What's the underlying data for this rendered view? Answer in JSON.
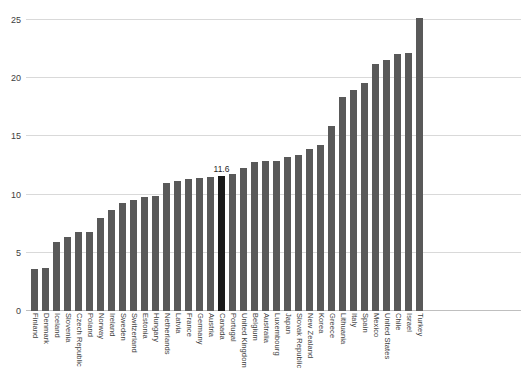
{
  "chart_data": {
    "type": "bar",
    "title": "",
    "subtitle": "",
    "xlabel": "",
    "ylabel": "",
    "ylim": [
      0,
      25
    ],
    "yticks": [
      0,
      5,
      10,
      15,
      20,
      25
    ],
    "ytick_labels": [
      "0",
      "5",
      "10",
      "15",
      "20",
      "25"
    ],
    "grid": true,
    "legend": null,
    "highlight_category": "Canada",
    "highlight_value_label": "11.6",
    "bar_color": "#595959",
    "highlight_color": "#1a1a1a",
    "gridline_color": "#d9d9d9",
    "categories": [
      "Finland",
      "Denmark",
      "Iceland",
      "Slovenia",
      "Czech Republic",
      "Poland",
      "Norway",
      "Ireland",
      "Sweden",
      "Switzerland",
      "Estonia",
      "Hungary",
      "Netherlands",
      "Latvia",
      "France",
      "Germany",
      "Austria",
      "Canada",
      "Portugal",
      "United Kingdom",
      "Belgium",
      "Australia",
      "Luxembourg",
      "Japan",
      "Slovak Republic",
      "New Zealand",
      "Korea",
      "Greece",
      "Lithuania",
      "Italy",
      "Spain",
      "Mexico",
      "United States",
      "Chile",
      "Israel",
      "Turkey"
    ],
    "values": [
      3.6,
      3.7,
      5.9,
      6.4,
      6.8,
      6.8,
      8.0,
      8.7,
      9.3,
      9.5,
      9.8,
      9.9,
      11.0,
      11.2,
      11.3,
      11.4,
      11.5,
      11.6,
      11.8,
      12.3,
      12.8,
      12.9,
      12.9,
      13.2,
      13.4,
      13.9,
      14.3,
      15.9,
      18.4,
      19.0,
      19.6,
      21.2,
      21.6,
      22.1,
      22.2,
      25.2
    ],
    "value_labels": [
      "",
      "",
      "",
      "",
      "",
      "",
      "",
      "",
      "",
      "",
      "",
      "",
      "",
      "",
      "",
      "",
      "",
      "11.6",
      "",
      "",
      "",
      "",
      "",
      "",
      "",
      "",
      "",
      "",
      "",
      "",
      "",
      "",
      "",
      "",
      "",
      ""
    ]
  }
}
